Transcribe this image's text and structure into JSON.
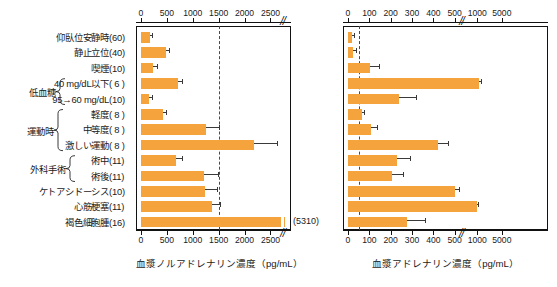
{
  "figure": {
    "title": "",
    "accent_color": "#f5a33c",
    "axis_color": "#111111",
    "whisker_color": "#3a3a3a",
    "dashed_line_color": "#4a4a4a"
  },
  "rows": [
    {
      "label": "仰臥位安静時",
      "n": "(60)",
      "group": null
    },
    {
      "label": "静止立位",
      "n": "(40)",
      "group": null
    },
    {
      "label": "喫煙",
      "n": "(10)",
      "group": null
    },
    {
      "label": "40 mg/dL以下",
      "n": "( 6 )",
      "group": "低血糖"
    },
    {
      "label": "95→60 mg/dL",
      "n": "(10)",
      "group": "低血糖"
    },
    {
      "label": "軽度",
      "n": "( 8 )",
      "group": "運動時"
    },
    {
      "label": "中等度",
      "n": "( 8 )",
      "group": "運動時"
    },
    {
      "label": "激しい運動",
      "n": "( 8 )",
      "group": "運動時"
    },
    {
      "label": "術中",
      "n": "(11)",
      "group": "外科手術"
    },
    {
      "label": "術後",
      "n": "(11)",
      "group": "外科手術"
    },
    {
      "label": "ケトアシドーシス",
      "n": "(10)",
      "group": null
    },
    {
      "label": "心筋梗塞",
      "n": "(11)",
      "group": null
    },
    {
      "label": "褐色細胞腫",
      "n": "(16)",
      "group": null
    }
  ],
  "groups": [
    {
      "name": "低血糖",
      "first_row": 3,
      "last_row": 4
    },
    {
      "name": "運動時",
      "first_row": 5,
      "last_row": 7
    },
    {
      "name": "外科手術",
      "first_row": 8,
      "last_row": 9
    }
  ],
  "chart_data": [
    {
      "type": "bar",
      "orientation": "horizontal",
      "id": "noradrenaline",
      "title": "",
      "xlabel": "血漿ノルアドレナリン濃度（pg/mL）",
      "ylabel": "",
      "xlim": [
        0,
        2800
      ],
      "xticks": [
        0,
        500,
        1000,
        1500,
        2000,
        2500
      ],
      "xticklabels": [
        "0",
        "500",
        "1000",
        "1500",
        "2000",
        "2500"
      ],
      "axis_break_after": 2650,
      "grid": false,
      "reference_line": 1500,
      "categories": [
        "仰臥位安静時",
        "静止立位",
        "喫煙",
        "40 mg/dL以下",
        "95→60 mg/dL",
        "軽度",
        "中等度",
        "激しい運動",
        "術中",
        "術後",
        "ケトアシドーシス",
        "心筋梗塞",
        "褐色細胞腫"
      ],
      "values": [
        170,
        480,
        225,
        720,
        155,
        430,
        1250,
        2180,
        680,
        1220,
        1230,
        1380,
        5310
      ],
      "errors": [
        45,
        60,
        80,
        75,
        50,
        55,
        250,
        450,
        110,
        270,
        240,
        140,
        0
      ],
      "annotations": [
        {
          "row": 12,
          "text": "(5310)",
          "note": "value exceeds axis, bar truncated"
        }
      ]
    },
    {
      "type": "bar",
      "orientation": "horizontal",
      "id": "adrenaline",
      "title": "",
      "xlabel": "血漿アドレナリン濃度（pg/mL）",
      "ylabel": "",
      "xlim": [
        0,
        5000
      ],
      "xticks": [
        0,
        100,
        200,
        300,
        400,
        500,
        1000,
        5000
      ],
      "xticklabels": [
        "0",
        "100",
        "200",
        "300",
        "400",
        "500",
        "1000",
        "5000"
      ],
      "axis_break_after": 500,
      "grid": false,
      "reference_line": 50,
      "categories": [
        "仰臥位安静時",
        "静止立位",
        "喫煙",
        "40 mg/dL以下",
        "95→60 mg/dL",
        "軽度",
        "中等度",
        "激しい運動",
        "術中",
        "術後",
        "ケトアシドーシス",
        "心筋梗塞",
        "褐色細胞腫"
      ],
      "values": [
        20,
        25,
        105,
        1250,
        240,
        65,
        110,
        420,
        230,
        205,
        515,
        1000,
        275
      ],
      "errors": [
        8,
        12,
        40,
        300,
        80,
        12,
        25,
        50,
        60,
        55,
        90,
        180,
        85
      ]
    }
  ]
}
